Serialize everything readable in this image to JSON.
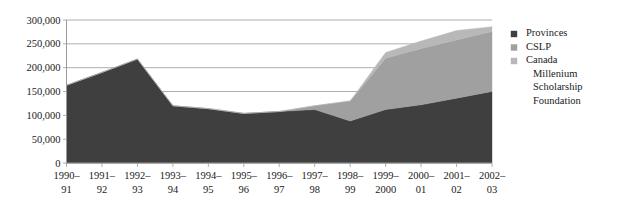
{
  "chart_data": {
    "type": "area",
    "stacked": true,
    "title": "",
    "subtitle": "",
    "xlabel": "",
    "ylabel": "",
    "categories": [
      "1990–91",
      "1991–92",
      "1992–93",
      "1993–94",
      "1994–95",
      "1995–96",
      "1996–97",
      "1997–98",
      "1998–99",
      "1999–2000",
      "2000–01",
      "2001–02",
      "2002–03"
    ],
    "category_lines": [
      [
        "1990–",
        "91"
      ],
      [
        "1991–",
        "92"
      ],
      [
        "1992–",
        "93"
      ],
      [
        "1993–",
        "94"
      ],
      [
        "1994–",
        "95"
      ],
      [
        "1995–",
        "96"
      ],
      [
        "1996–",
        "97"
      ],
      [
        "1997–",
        "98"
      ],
      [
        "1998–",
        "99"
      ],
      [
        "1999–",
        "2000"
      ],
      [
        "2000–",
        "01"
      ],
      [
        "2001–",
        "02"
      ],
      [
        "2002–",
        "03"
      ]
    ],
    "series": [
      {
        "name": "Provinces",
        "color": "#3f3f3f",
        "values": [
          163000,
          190000,
          218000,
          120000,
          114000,
          104000,
          108000,
          112000,
          88000,
          112000,
          122000,
          136000,
          150000
        ]
      },
      {
        "name": "CSLP",
        "color": "#a0a0a0",
        "values": [
          0,
          0,
          0,
          0,
          0,
          0,
          0,
          8000,
          42000,
          108000,
          118000,
          122000,
          126000
        ]
      },
      {
        "name": "Canada Millenium Scholarship Foundation",
        "color": "#b8b8b8",
        "values": [
          0,
          0,
          0,
          0,
          0,
          0,
          0,
          0,
          0,
          12000,
          16000,
          20000,
          10000
        ]
      }
    ],
    "totals": [
      163000,
      190000,
      218000,
      120000,
      114000,
      104000,
      108000,
      120000,
      130000,
      232000,
      256000,
      278000,
      286000
    ],
    "ylim": [
      0,
      300000
    ],
    "ytick_values": [
      0,
      50000,
      100000,
      150000,
      200000,
      250000,
      300000
    ],
    "ytick_labels": [
      "0",
      "50,000",
      "100,000",
      "150,000",
      "200,000",
      "250,000",
      "300,000"
    ],
    "grid": true,
    "legend_position": "right",
    "legend": [
      {
        "label": "Provinces",
        "color": "#3f3f3f",
        "lines": [
          "Provinces"
        ]
      },
      {
        "label": "CSLP",
        "color": "#a0a0a0",
        "lines": [
          "CSLP"
        ]
      },
      {
        "label": "Canada Millenium Scholarship Foundation",
        "color": "#b8b8b8",
        "lines": [
          "Canada",
          "Millenium",
          "Scholarship",
          "Foundation"
        ]
      }
    ]
  }
}
